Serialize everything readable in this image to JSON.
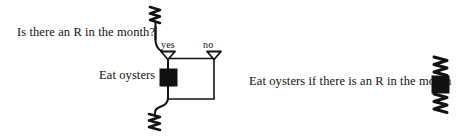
{
  "figure": {
    "type": "nassi-shneiderman-style-flow-diagram",
    "background_color": "#ffffff",
    "ink_color": "#121212",
    "left_diagram": {
      "question": {
        "text": "Is there an R in the month?",
        "role": "decision-condition"
      },
      "branches": [
        {
          "id": "yes",
          "label": "yes",
          "marker": "hollow-down-triangle"
        },
        {
          "id": "no",
          "label": "no",
          "marker": "hollow-down-triangle"
        }
      ],
      "action": {
        "text": "Eat oysters",
        "marker": "filled-black-square"
      },
      "terminators": [
        {
          "id": "entry",
          "marker": "squiggle",
          "position": "top"
        },
        {
          "id": "exit",
          "marker": "squiggle",
          "position": "bottom"
        }
      ]
    },
    "right_diagram": {
      "statement": "Eat oysters if there is an R in the month",
      "symbol": {
        "parts": [
          "squiggle",
          "filled-black-square",
          "squiggle"
        ],
        "orientation": "vertical"
      }
    }
  }
}
